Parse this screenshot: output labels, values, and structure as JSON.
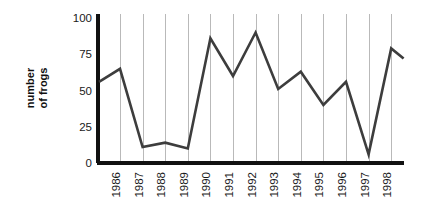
{
  "chart_data": {
    "type": "line",
    "title": "",
    "subtitle": "",
    "xlabel": "",
    "ylabel": "number\nof frogs",
    "ylabel_line1": "number",
    "ylabel_line2": "of frogs",
    "categories": [
      "1986",
      "1987",
      "1988",
      "1989",
      "1990",
      "1991",
      "1992",
      "1993",
      "1994",
      "1995",
      "1996",
      "1997",
      "1998"
    ],
    "x_tick_labels": [
      "1986",
      "1987",
      "1988",
      "1989",
      "1990",
      "1991",
      "1992",
      "1993",
      "1994",
      "1995",
      "1996",
      "1997",
      "1998"
    ],
    "x_tick_rotation_deg": -90,
    "y_tick_labels": [
      "0",
      "25",
      "50",
      "75",
      "100"
    ],
    "y_ticks": [
      0,
      25,
      50,
      75,
      100
    ],
    "ylim": [
      0,
      100
    ],
    "grid": "vertical-only",
    "legend": "none",
    "series": [
      {
        "name": "number of frogs",
        "color": "#3d3d3d",
        "values": [
          65,
          11,
          14,
          10,
          86,
          60,
          90,
          51,
          63,
          40,
          56,
          6,
          79
        ],
        "leading_value": 56,
        "trailing_value": 72
      }
    ],
    "annotations": []
  },
  "axes": {
    "y_axis_color": "#111111",
    "x_axis_color": "#111111",
    "gridline_color": "#b9b9b9",
    "background": "#ffffff"
  }
}
